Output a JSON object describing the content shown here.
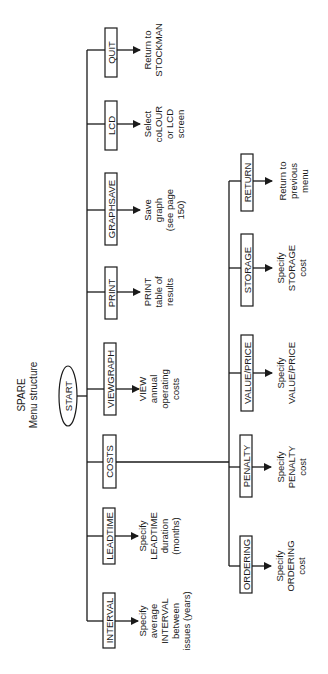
{
  "title": {
    "line1": "SPARE",
    "line2": "Menu structure"
  },
  "start": {
    "label": "START"
  },
  "main_menu": [
    {
      "id": "quit",
      "label": "QUIT",
      "desc": [
        "Return to",
        "STOCKMAN"
      ]
    },
    {
      "id": "lcd",
      "label": "LCD",
      "desc": [
        "Select",
        "coLOUR",
        "or LCD",
        "screen"
      ]
    },
    {
      "id": "graphsave",
      "label": "GRAPHSAVE",
      "desc": [
        "Save",
        "graph",
        "(see page",
        "150)"
      ]
    },
    {
      "id": "print",
      "label": "PRINT",
      "desc": [
        "PRINT",
        "table of",
        "results"
      ]
    },
    {
      "id": "viewgraph",
      "label": "VIEWGRAPH",
      "desc": [
        "VIEW",
        "annual",
        "operating",
        "costs"
      ]
    },
    {
      "id": "costs",
      "label": "COSTS",
      "desc": []
    },
    {
      "id": "leadtime",
      "label": "LEADTIME",
      "desc": [
        "Specify",
        "LEADTIME",
        "duration",
        "(months)"
      ]
    },
    {
      "id": "interval",
      "label": "INTERVAL",
      "desc": [
        "Specify",
        "average",
        "INTERVAL",
        "between",
        "issues (years)"
      ]
    }
  ],
  "costs_menu": [
    {
      "id": "return",
      "label": "RETURN",
      "desc": [
        "Return to",
        "previous",
        "menu"
      ]
    },
    {
      "id": "storage",
      "label": "STORAGE",
      "desc": [
        "Specify",
        "STORAGE",
        "cost"
      ]
    },
    {
      "id": "value_price",
      "label": "VALUE/PRICE",
      "desc": [
        "Specify",
        "VALUE/PRICE"
      ]
    },
    {
      "id": "penalty",
      "label": "PENALTY",
      "desc": [
        "Specify",
        "PENALTY",
        "cost"
      ]
    },
    {
      "id": "ordering",
      "label": "ORDERING",
      "desc": [
        "Specify",
        "ORDERING",
        "cost"
      ]
    }
  ]
}
